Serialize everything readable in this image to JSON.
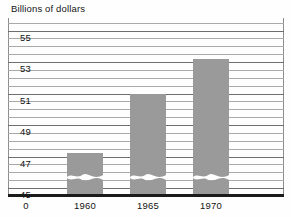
{
  "chart_data": {
    "type": "bar",
    "title": "Billions of dollars",
    "xlabel": "",
    "ylabel": "",
    "categories": [
      "1960",
      "1965",
      "1970"
    ],
    "values": [
      47.2,
      51.0,
      53.2
    ],
    "ylim": [
      44.5,
      55.8
    ],
    "ytick_labels": [
      "55",
      "53",
      "51",
      "49",
      "47",
      "45"
    ],
    "ytick_values": [
      55,
      53,
      51,
      49,
      47,
      45
    ],
    "gridlines_all": [
      55.5,
      55,
      54.5,
      54,
      53.5,
      53,
      52.5,
      52,
      51.5,
      51,
      50.5,
      50,
      49.5,
      49,
      48.5,
      48,
      47.5,
      47,
      46.5,
      46,
      45.5,
      45
    ],
    "xtick_labels": [
      "0",
      "1960",
      "1965",
      "1970"
    ],
    "grid": true,
    "legend": "none",
    "broken_axis": true,
    "broken_axis_note": "wavy break near baseline on each bar",
    "bar_color": "#9a9a9a",
    "axis_color": "#1b1b1b",
    "grid_color": "#6e6e6e"
  },
  "axis": {
    "origin_label": "0"
  }
}
